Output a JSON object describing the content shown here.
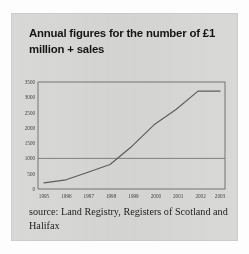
{
  "chart_title": "Annual figures for the number of £1 million + sales",
  "source_note": "source: Land Registry, Registers of Scotland and Halifax",
  "colors": {
    "card_background": "#d8d8d6",
    "page_background": "#fdfdfd",
    "title_text": "#151515",
    "axis_line": "#6c6c68",
    "series_line": "#5d5d59",
    "tick_text": "#42423f"
  },
  "chart_data": {
    "type": "line",
    "title": "Annual figures for the number of £1 million + sales",
    "xlabel": "",
    "ylabel": "",
    "x": [
      "1995",
      "1996",
      "1997",
      "1998",
      "1999",
      "2000",
      "2001",
      "2002",
      "2003"
    ],
    "values": [
      200,
      300,
      550,
      800,
      1400,
      2100,
      2600,
      3200,
      3200
    ],
    "xlim": [
      "1995",
      "2003"
    ],
    "ylim": [
      0,
      3500
    ],
    "yticks": [
      0,
      500,
      1000,
      1500,
      2000,
      2500,
      3000,
      3500
    ],
    "ytick_labels": [
      "0",
      "500",
      "1000",
      "1500",
      "2000",
      "2500",
      "3000",
      "3500"
    ],
    "xtick_labels": [
      "1995",
      "1996",
      "1997",
      "1998",
      "1999",
      "2000",
      "2001",
      "2002",
      "2003"
    ],
    "gridlines": [
      1000
    ],
    "grid": "single horizontal gridline at 1000",
    "legend": "none",
    "markers": false,
    "series_name": "Number of £1 million + sales"
  }
}
